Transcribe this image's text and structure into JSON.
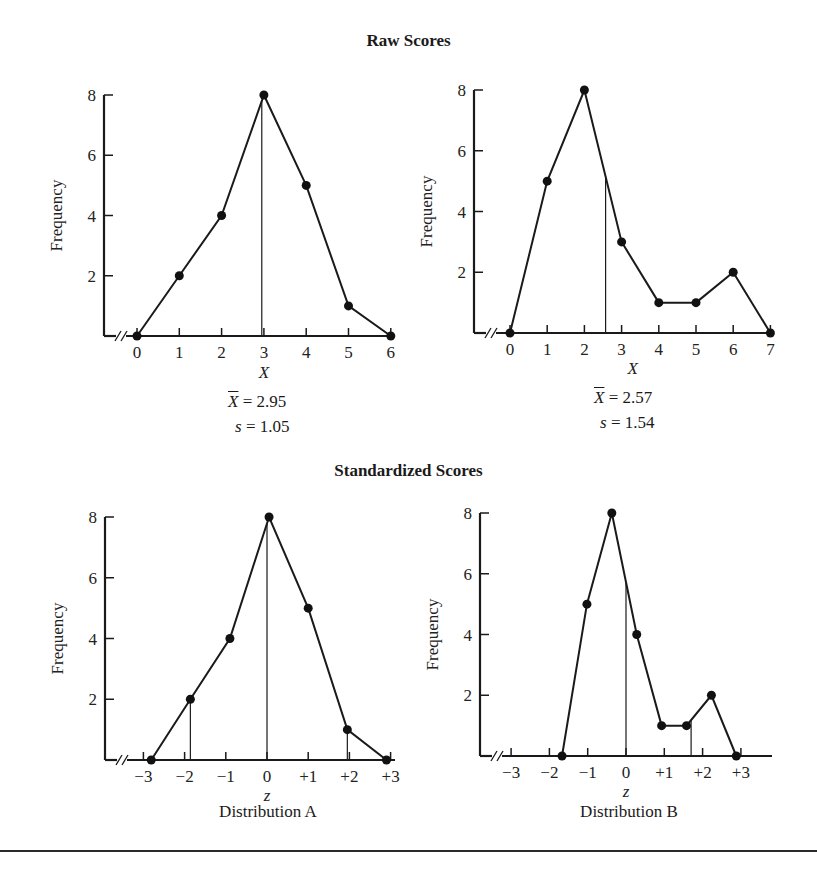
{
  "headings": {
    "raw": "Raw Scores",
    "standardized": "Standardized Scores"
  },
  "chart_data": [
    {
      "id": "raw-A",
      "type": "line",
      "title": "Raw Scores",
      "xlabel": "X",
      "ylabel": "Frequency",
      "x": [
        0,
        1,
        2,
        3,
        4,
        5,
        6
      ],
      "values": [
        0,
        2,
        4,
        8,
        5,
        1,
        0
      ],
      "xticks": [
        "0",
        "1",
        "2",
        "3",
        "4",
        "5",
        "6"
      ],
      "yticks": [
        "2",
        "4",
        "6",
        "8"
      ],
      "ylim": [
        0,
        8
      ],
      "mean_line": 2.95,
      "stats": {
        "mean_label": "X",
        "mean_value": "= 2.95",
        "sd_label": "s",
        "sd_value": "= 1.05"
      },
      "markers": true,
      "axis_break": true
    },
    {
      "id": "raw-B",
      "type": "line",
      "title": "Raw Scores",
      "xlabel": "X",
      "ylabel": "Frequency",
      "x": [
        0,
        1,
        2,
        3,
        4,
        5,
        6,
        7
      ],
      "values": [
        0,
        5,
        8,
        3,
        1,
        1,
        2,
        0
      ],
      "xticks": [
        "0",
        "1",
        "2",
        "3",
        "4",
        "5",
        "6",
        "7"
      ],
      "yticks": [
        "2",
        "4",
        "6",
        "8"
      ],
      "ylim": [
        0,
        8
      ],
      "mean_line": 2.57,
      "stats": {
        "mean_label": "X",
        "mean_value": "= 2.57",
        "sd_label": "s",
        "sd_value": "= 1.54"
      },
      "markers": true,
      "axis_break": true
    },
    {
      "id": "std-A",
      "type": "line",
      "title": "Standardized Scores",
      "xlabel": "z",
      "ylabel": "Frequency",
      "caption": "Distribution A",
      "x": [
        -2.81,
        -1.86,
        -0.9,
        0.05,
        1.0,
        1.95,
        2.9
      ],
      "values": [
        0,
        2,
        4,
        8,
        5,
        1,
        0
      ],
      "xticks": [
        "−3",
        "−2",
        "−1",
        "0",
        "+1",
        "+2",
        "+3"
      ],
      "xtick_values": [
        -3,
        -2,
        -1,
        0,
        1,
        2,
        3
      ],
      "yticks": [
        "2",
        "4",
        "6",
        "8"
      ],
      "ylim": [
        0,
        8
      ],
      "reference_lines": [
        -1.86,
        0,
        1.95
      ],
      "markers": true,
      "axis_break": true
    },
    {
      "id": "std-B",
      "type": "line",
      "title": "Standardized Scores",
      "xlabel": "z",
      "ylabel": "Frequency",
      "caption": "Distribution B",
      "x": [
        -1.67,
        -1.02,
        -0.37,
        0.28,
        0.93,
        1.58,
        2.23,
        2.88
      ],
      "values": [
        0,
        5,
        8,
        4,
        1,
        1,
        2,
        0
      ],
      "xticks": [
        "−3",
        "−2",
        "−1",
        "0",
        "+1",
        "+2",
        "+3"
      ],
      "xtick_values": [
        -3,
        -2,
        -1,
        0,
        1,
        2,
        3
      ],
      "yticks": [
        "2",
        "4",
        "6",
        "8"
      ],
      "ylim": [
        0,
        8
      ],
      "reference_lines": [
        0,
        1.7
      ],
      "markers": true,
      "axis_break": true
    }
  ]
}
